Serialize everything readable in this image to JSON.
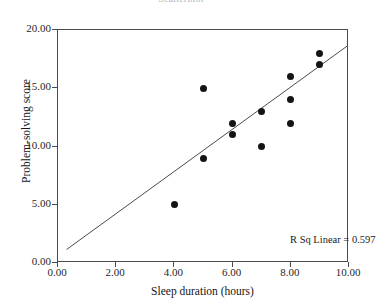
{
  "chart_data": {
    "type": "scatter",
    "title": "Scatterplot",
    "xlabel": "Sleep duration (hours)",
    "ylabel": "Problem-solving score",
    "xlim": [
      0,
      10
    ],
    "ylim": [
      0,
      20
    ],
    "xticks": [
      "0.00",
      "2.00",
      "4.00",
      "6.00",
      "8.00",
      "10.00"
    ],
    "xtick_values": [
      0,
      2,
      4,
      6,
      8,
      10
    ],
    "yticks": [
      "0.00",
      "5.00",
      "10.00",
      "15.00",
      "20.00"
    ],
    "ytick_values": [
      0,
      5,
      10,
      15,
      20
    ],
    "grid": false,
    "legend": false,
    "points": [
      {
        "x": 4,
        "y": 5
      },
      {
        "x": 5,
        "y": 9
      },
      {
        "x": 5,
        "y": 15
      },
      {
        "x": 6,
        "y": 11
      },
      {
        "x": 6,
        "y": 12
      },
      {
        "x": 7,
        "y": 10
      },
      {
        "x": 7,
        "y": 13
      },
      {
        "x": 8,
        "y": 12
      },
      {
        "x": 8,
        "y": 14
      },
      {
        "x": 8,
        "y": 16
      },
      {
        "x": 9,
        "y": 17
      },
      {
        "x": 9,
        "y": 18
      }
    ],
    "fit_line": {
      "type": "linear",
      "x_start": 0.3,
      "y_start": 1.0,
      "x_end": 10.0,
      "y_end": 18.6,
      "color": "#4a4a4a"
    },
    "annotation": "R Sq Linear = 0.597",
    "point_color": "#141414",
    "axis_color": "#4a4a4a"
  }
}
